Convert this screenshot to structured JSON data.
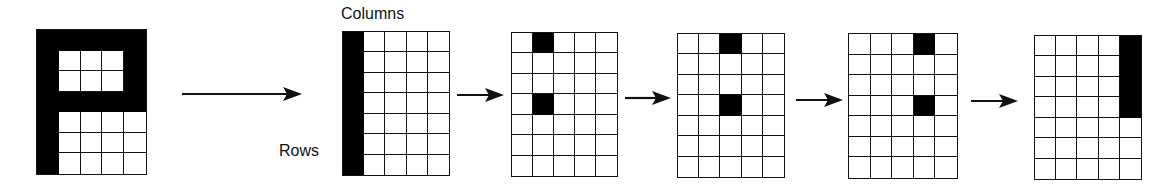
{
  "diagram": {
    "labels": {
      "columns": "Columns",
      "rows": "Rows"
    },
    "grid_size": {
      "cols": 5,
      "rows": 7
    },
    "colors": {
      "filled": "#000000",
      "empty": "#ffffff",
      "line": "#111111"
    },
    "grids": [
      {
        "id": "letter-p",
        "x": 36,
        "y": 29,
        "w": 111,
        "h": 146,
        "filled": [
          [
            1,
            1,
            1,
            1,
            1
          ],
          [
            1,
            0,
            0,
            0,
            1
          ],
          [
            1,
            0,
            0,
            0,
            1
          ],
          [
            1,
            1,
            1,
            1,
            1
          ],
          [
            1,
            0,
            0,
            0,
            0
          ],
          [
            1,
            0,
            0,
            0,
            0
          ],
          [
            1,
            0,
            0,
            0,
            0
          ]
        ]
      },
      {
        "id": "column-1",
        "x": 342,
        "y": 31,
        "w": 108,
        "h": 145,
        "filled": [
          [
            1,
            0,
            0,
            0,
            0
          ],
          [
            1,
            0,
            0,
            0,
            0
          ],
          [
            1,
            0,
            0,
            0,
            0
          ],
          [
            1,
            0,
            0,
            0,
            0
          ],
          [
            1,
            0,
            0,
            0,
            0
          ],
          [
            1,
            0,
            0,
            0,
            0
          ],
          [
            1,
            0,
            0,
            0,
            0
          ]
        ]
      },
      {
        "id": "column-2",
        "x": 511,
        "y": 32,
        "w": 107,
        "h": 145,
        "filled": [
          [
            0,
            1,
            0,
            0,
            0
          ],
          [
            0,
            0,
            0,
            0,
            0
          ],
          [
            0,
            0,
            0,
            0,
            0
          ],
          [
            0,
            1,
            0,
            0,
            0
          ],
          [
            0,
            0,
            0,
            0,
            0
          ],
          [
            0,
            0,
            0,
            0,
            0
          ],
          [
            0,
            0,
            0,
            0,
            0
          ]
        ]
      },
      {
        "id": "column-3",
        "x": 677,
        "y": 33,
        "w": 108,
        "h": 145,
        "filled": [
          [
            0,
            0,
            1,
            0,
            0
          ],
          [
            0,
            0,
            0,
            0,
            0
          ],
          [
            0,
            0,
            0,
            0,
            0
          ],
          [
            0,
            0,
            1,
            0,
            0
          ],
          [
            0,
            0,
            0,
            0,
            0
          ],
          [
            0,
            0,
            0,
            0,
            0
          ],
          [
            0,
            0,
            0,
            0,
            0
          ]
        ]
      },
      {
        "id": "column-4",
        "x": 848,
        "y": 33,
        "w": 110,
        "h": 146,
        "filled": [
          [
            0,
            0,
            0,
            1,
            0
          ],
          [
            0,
            0,
            0,
            0,
            0
          ],
          [
            0,
            0,
            0,
            0,
            0
          ],
          [
            0,
            0,
            0,
            1,
            0
          ],
          [
            0,
            0,
            0,
            0,
            0
          ],
          [
            0,
            0,
            0,
            0,
            0
          ],
          [
            0,
            0,
            0,
            0,
            0
          ]
        ]
      },
      {
        "id": "column-5",
        "x": 1034,
        "y": 35,
        "w": 108,
        "h": 145,
        "filled": [
          [
            0,
            0,
            0,
            0,
            1
          ],
          [
            0,
            0,
            0,
            0,
            1
          ],
          [
            0,
            0,
            0,
            0,
            1
          ],
          [
            0,
            0,
            0,
            0,
            1
          ],
          [
            0,
            0,
            0,
            0,
            0
          ],
          [
            0,
            0,
            0,
            0,
            0
          ],
          [
            0,
            0,
            0,
            0,
            0
          ]
        ]
      }
    ],
    "arrows": [
      {
        "id": "arrow-main",
        "x1": 182,
        "x2": 302,
        "y": 94
      },
      {
        "id": "arrow-1",
        "x1": 457,
        "x2": 504,
        "y": 95
      },
      {
        "id": "arrow-2",
        "x1": 625,
        "x2": 671,
        "y": 98
      },
      {
        "id": "arrow-3",
        "x1": 796,
        "x2": 843,
        "y": 100
      },
      {
        "id": "arrow-4",
        "x1": 971,
        "x2": 1018,
        "y": 101
      }
    ]
  }
}
